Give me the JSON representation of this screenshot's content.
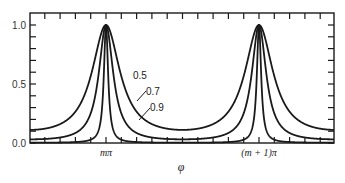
{
  "chart_data": {
    "type": "line",
    "title": "",
    "xlabel": "φ",
    "ylabel": "",
    "ylim": [
      0.0,
      1.0
    ],
    "xlim_periods": [
      -1.25,
      0.8
    ],
    "x_ticks": [
      {
        "label": "mπ",
        "phase": 0
      },
      {
        "label": "(m + 1)π",
        "phase": 1
      }
    ],
    "y_ticks": [
      {
        "label": "0.0",
        "value": 0.0
      },
      {
        "label": "0.5",
        "value": 0.5
      },
      {
        "label": "1.0",
        "value": 1.0
      }
    ],
    "function": "T = 1 / (1 + F·sin²(φ)),  F = 4R/(1−R)²",
    "series": [
      {
        "name": "0.5",
        "R": 0.5,
        "peak": 1.0,
        "min": 0.111
      },
      {
        "name": "0.7",
        "R": 0.7,
        "peak": 1.0,
        "min": 0.031
      },
      {
        "name": "0.9",
        "R": 0.9,
        "peak": 1.0,
        "min": 0.003
      }
    ],
    "grid": false,
    "legend_position": "inline labels with leader lines near first peak"
  },
  "layout": {
    "frame": {
      "left": 30,
      "right": 334,
      "top": 13,
      "bottom": 143
    },
    "y_px": {
      "zero": 143,
      "one": 25
    },
    "peak_px": [
      106,
      259
    ],
    "stroke_color": "#1a1a1a"
  },
  "labels": [
    {
      "text": "0.5",
      "x": 133,
      "y": 79,
      "leader": null
    },
    {
      "text": "0.7",
      "x": 146,
      "y": 95,
      "leader": [
        146,
        91,
        137,
        101
      ]
    },
    {
      "text": "0.9",
      "x": 150,
      "y": 111,
      "leader": [
        150,
        108,
        139,
        120
      ]
    }
  ]
}
